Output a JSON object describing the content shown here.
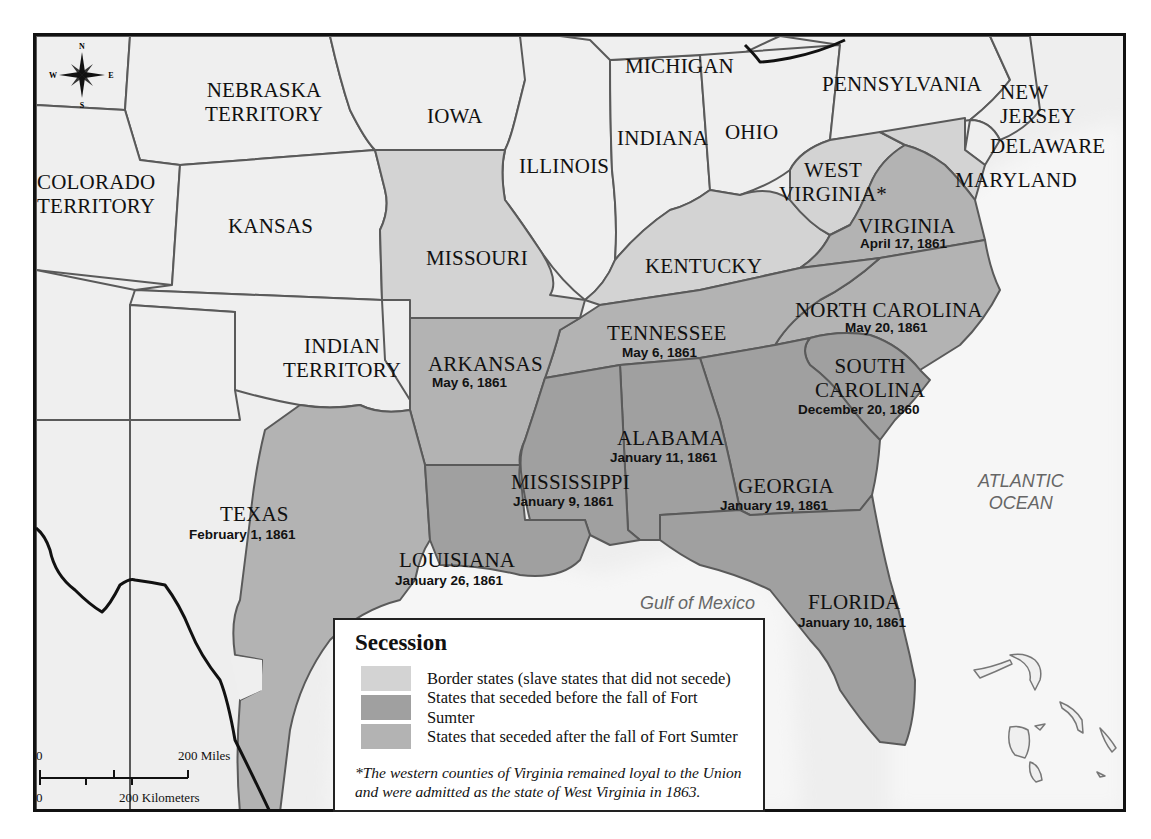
{
  "map": {
    "title": "Secession",
    "colors": {
      "background": "#eeeeee",
      "union_state": "#efefef",
      "border_state": "#d3d3d3",
      "seceded_before_sumter": "#a0a0a0",
      "seceded_after_sumter": "#b3b3b3",
      "water": "#f4f4f4",
      "boundary": "#555555"
    },
    "compass": {
      "n": "N",
      "s": "S",
      "e": "E",
      "w": "W"
    },
    "regions": {
      "nebraska": "NEBRASKA\nTERRITORY",
      "nebraska_l1": "NEBRASKA",
      "nebraska_l2": "TERRITORY",
      "iowa": "IOWA",
      "michigan": "MICHIGAN",
      "pennsylvania": "PENNSYLVANIA",
      "new_jersey_l1": "NEW",
      "new_jersey_l2": "JERSEY",
      "delaware": "DELAWARE",
      "maryland": "MARYLAND",
      "indiana": "INDIANA",
      "ohio": "OHIO",
      "illinois": "ILLINOIS",
      "west_virginia_l1": "WEST",
      "west_virginia_l2": "VIRGINIA*",
      "colorado_l1": "COLORADO",
      "colorado_l2": "TERRITORY",
      "kansas": "KANSAS",
      "missouri": "MISSOURI",
      "kentucky": "KENTUCKY",
      "virginia": "VIRGINIA",
      "virginia_date": "April 17, 1861",
      "north_carolina": "NORTH CAROLINA",
      "north_carolina_date": "May 20, 1861",
      "tennessee": "TENNESSEE",
      "tennessee_date": "May 6, 1861",
      "indian_l1": "INDIAN",
      "indian_l2": "TERRITORY",
      "arkansas": "ARKANSAS",
      "arkansas_date": "May 6, 1861",
      "south_carolina_l1": "SOUTH",
      "south_carolina_l2": "CAROLINA",
      "south_carolina_date": "December 20, 1860",
      "alabama": "ALABAMA",
      "alabama_date": "January 11, 1861",
      "mississippi": "MISSISSIPPI",
      "mississippi_date": "January 9, 1861",
      "georgia": "GEORGIA",
      "georgia_date": "January 19, 1861",
      "texas": "TEXAS",
      "texas_date": "February 1, 1861",
      "louisiana": "LOUISIANA",
      "louisiana_date": "January 26, 1861",
      "florida": "FLORIDA",
      "florida_date": "January 10, 1861"
    },
    "water": {
      "atlantic_l1": "ATLANTIC",
      "atlantic_l2": "OCEAN",
      "gulf": "Gulf of Mexico"
    },
    "legend": {
      "title": "Secession",
      "items": [
        {
          "label": "Border states (slave states that did not secede)",
          "color": "#d3d3d3"
        },
        {
          "label": "States that seceded before the fall of Fort Sumter",
          "color": "#a0a0a0"
        },
        {
          "label": "States that seceded after the fall of Fort Sumter",
          "color": "#b3b3b3"
        }
      ],
      "note_l1": "*The western counties of Virginia remained loyal to the Union",
      "note_l2": "and were admitted as the state of West Virginia in 1863."
    },
    "scale": {
      "miles_zero": "0",
      "miles_label": "200 Miles",
      "km_zero": "0",
      "km_label": "200 Kilometers"
    }
  }
}
